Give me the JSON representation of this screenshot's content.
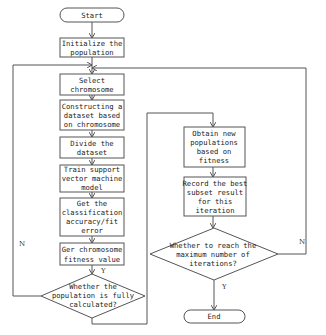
{
  "flowchart": {
    "start": "Start",
    "end": "End",
    "init": [
      "Initialize the",
      "population"
    ],
    "select": [
      "Select",
      "chromosome"
    ],
    "construct": [
      "Constructing a",
      "dataset based",
      "on chromosome"
    ],
    "divide": [
      "Divide the",
      "dataset"
    ],
    "train": [
      "Train support",
      "vector machine",
      "model"
    ],
    "classify": [
      "Get the",
      "classification",
      "accuracy/fit",
      "error"
    ],
    "fitness": [
      "Ger chromosome",
      "fitness value"
    ],
    "decision1": [
      "Whether the",
      "population is fully",
      "calculated?"
    ],
    "obtain": [
      "Obtain new",
      "populations",
      "based on",
      "fitness"
    ],
    "record": [
      "Record the best",
      "subset result",
      "for this",
      "iteration"
    ],
    "decision2": [
      "Whether to reach the",
      "maximum number of",
      "iterations?"
    ],
    "labels": {
      "yes1": "Y",
      "no1": "N",
      "yes2": "Y",
      "no2": "N"
    }
  }
}
